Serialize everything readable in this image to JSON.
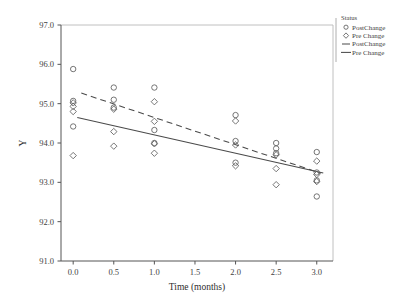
{
  "chart_data": {
    "type": "scatter",
    "title": "",
    "xlabel": "Time (months)",
    "ylabel": "Y",
    "xlim": [
      -0.15,
      3.2
    ],
    "ylim": [
      91.0,
      97.0
    ],
    "xticks": [
      "0.0",
      "0.5",
      "1.0",
      "1.5",
      "2.0",
      "2.5",
      "3.0"
    ],
    "xtick_values": [
      0.0,
      0.5,
      1.0,
      1.5,
      2.0,
      2.5,
      3.0
    ],
    "yticks": [
      "91.0",
      "92.0",
      "93.0",
      "94.0",
      "95.0",
      "96.0",
      "97.0"
    ],
    "ytick_values": [
      91.0,
      92.0,
      93.0,
      94.0,
      95.0,
      96.0,
      97.0
    ],
    "grid": false,
    "legend_position": "right",
    "legend_title": "Status",
    "legend_entries": [
      {
        "label": "PostChange",
        "marker": "circle",
        "type": "marker"
      },
      {
        "label": "Pre Change",
        "marker": "diamond",
        "type": "marker"
      },
      {
        "label": "PostChange",
        "marker": "dashed-line",
        "type": "line"
      },
      {
        "label": "Pre Change",
        "marker": "solid-line",
        "type": "line"
      }
    ],
    "series": [
      {
        "name": "PostChange",
        "marker": "circle",
        "points": [
          [
            0.0,
            95.88
          ],
          [
            0.0,
            95.07
          ],
          [
            0.0,
            94.42
          ],
          [
            0.5,
            95.41
          ],
          [
            0.5,
            95.1
          ],
          [
            0.5,
            94.9
          ],
          [
            1.0,
            95.41
          ],
          [
            1.0,
            94.33
          ],
          [
            1.0,
            94.0
          ],
          [
            2.0,
            94.71
          ],
          [
            2.0,
            94.05
          ],
          [
            2.0,
            93.5
          ],
          [
            2.5,
            94.0
          ],
          [
            2.5,
            93.86
          ],
          [
            2.5,
            93.74
          ],
          [
            3.0,
            93.77
          ],
          [
            3.0,
            93.25
          ],
          [
            3.0,
            93.05
          ],
          [
            3.0,
            92.64
          ]
        ]
      },
      {
        "name": "Pre Change",
        "marker": "diamond",
        "points": [
          [
            0.0,
            95.02
          ],
          [
            0.0,
            94.93
          ],
          [
            0.0,
            94.8
          ],
          [
            0.0,
            93.68
          ],
          [
            0.5,
            94.86
          ],
          [
            0.5,
            94.29
          ],
          [
            0.5,
            93.92
          ],
          [
            1.0,
            95.05
          ],
          [
            1.0,
            94.55
          ],
          [
            1.0,
            93.98
          ],
          [
            1.0,
            93.74
          ],
          [
            2.0,
            94.56
          ],
          [
            2.0,
            93.95
          ],
          [
            2.0,
            93.42
          ],
          [
            2.5,
            93.7
          ],
          [
            2.5,
            93.35
          ],
          [
            2.5,
            92.94
          ],
          [
            3.0,
            93.54
          ],
          [
            3.0,
            93.2
          ],
          [
            3.0,
            93.02
          ]
        ]
      }
    ],
    "fit_lines": [
      {
        "name": "PostChange",
        "style": "dashed",
        "x": [
          0.1,
          3.05
        ],
        "y": [
          95.27,
          93.23
        ]
      },
      {
        "name": "Pre Change",
        "style": "solid",
        "x": [
          0.05,
          3.08
        ],
        "y": [
          94.65,
          93.24
        ]
      }
    ]
  }
}
